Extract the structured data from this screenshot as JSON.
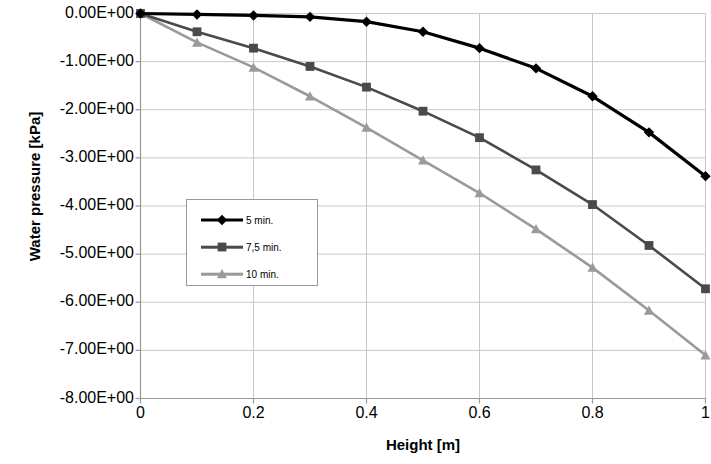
{
  "chart_data": {
    "type": "line",
    "title": "",
    "xlabel": "Height [m]",
    "ylabel": "Water pressure [kPa]",
    "xlim": [
      0,
      1
    ],
    "ylim": [
      -8,
      0
    ],
    "grid": true,
    "legend_position": "center-left",
    "x_ticks": [
      "0",
      "0.2",
      "0.4",
      "0.6",
      "0.8",
      "1"
    ],
    "x_tick_values": [
      0,
      0.2,
      0.4,
      0.6,
      0.8,
      1
    ],
    "y_ticks": [
      "0.00E+00",
      "-1.00E+00",
      "-2.00E+00",
      "-3.00E+00",
      "-4.00E+00",
      "-5.00E+00",
      "-6.00E+00",
      "-7.00E+00",
      "-8.00E+00"
    ],
    "y_tick_values": [
      0,
      -1,
      -2,
      -3,
      -4,
      -5,
      -6,
      -7,
      -8
    ],
    "x": [
      0,
      0.1,
      0.2,
      0.3,
      0.4,
      0.5,
      0.6,
      0.7,
      0.8,
      0.9,
      1.0
    ],
    "series": [
      {
        "name": "5 min.",
        "color": "#000000",
        "marker": "diamond",
        "values": [
          0.0,
          -0.02,
          -0.04,
          -0.07,
          -0.17,
          -0.38,
          -0.72,
          -1.14,
          -1.72,
          -2.47,
          -3.38
        ]
      },
      {
        "name": "7,5 min.",
        "color": "#4a4a4a",
        "marker": "square",
        "values": [
          0.0,
          -0.38,
          -0.72,
          -1.1,
          -1.53,
          -2.03,
          -2.58,
          -3.25,
          -3.97,
          -4.82,
          -5.72
        ]
      },
      {
        "name": "10 min.",
        "color": "#9a9a9a",
        "marker": "triangle",
        "values": [
          0.0,
          -0.6,
          -1.12,
          -1.72,
          -2.37,
          -3.05,
          -3.73,
          -4.48,
          -5.28,
          -6.17,
          -7.1
        ]
      }
    ]
  },
  "legend": {
    "items": [
      {
        "label": "5 min."
      },
      {
        "label": "7,5 min."
      },
      {
        "label": "10 min."
      }
    ]
  },
  "axes": {
    "grid_color": "#c8c8c8",
    "axis_color": "#9a9a9a"
  }
}
